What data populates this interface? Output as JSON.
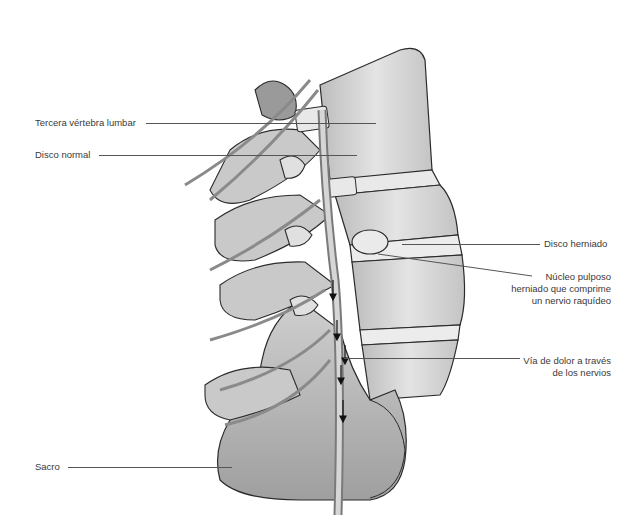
{
  "diagram": {
    "labels": {
      "third_lumbar_vertebra": "Tercera vértebra lumbar",
      "normal_disc": "Disco normal",
      "herniated_disc": "Disco herniado",
      "nucleus_line1": "Núcleo pulposo",
      "nucleus_line2": "herniado que comprime",
      "nucleus_line3": "un nervio raquídeo",
      "pain_path_line1": "Vía de dolor a través",
      "pain_path_line2": "de los nervios",
      "sacrum": "Sacro"
    },
    "colors": {
      "background": "#ffffff",
      "label_text": "#3a3a3a",
      "leader_line": "#555555",
      "bone_fill": "#d9d9d9",
      "bone_shadow": "#a9a9a9",
      "outline": "#2b2b2b"
    }
  }
}
